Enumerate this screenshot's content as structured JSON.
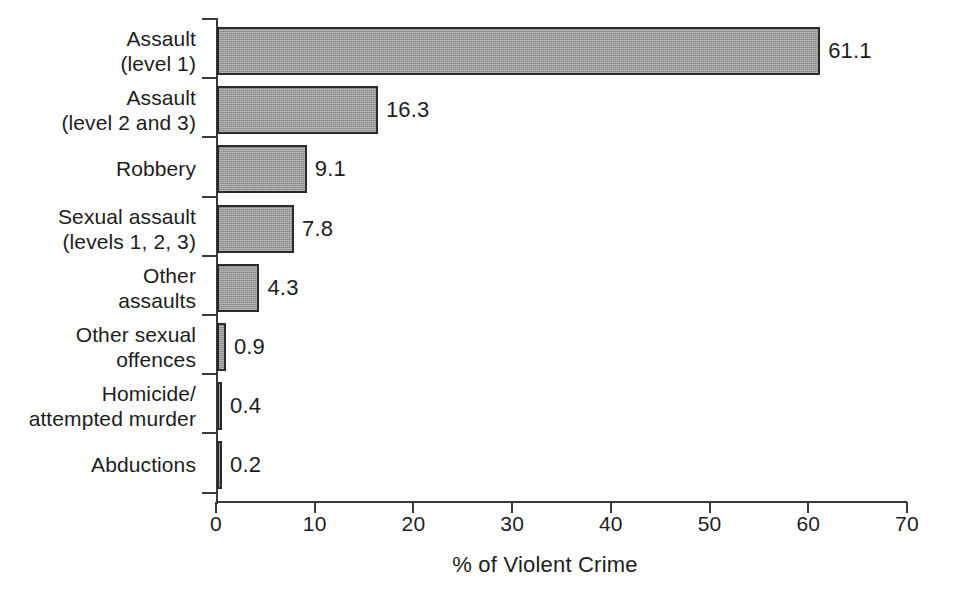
{
  "chart_data": {
    "type": "bar",
    "orientation": "horizontal",
    "title": "",
    "xlabel": "% of Violent Crime",
    "ylabel": "",
    "xlim": [
      0,
      70
    ],
    "xticks": [
      0,
      10,
      20,
      30,
      40,
      50,
      60,
      70
    ],
    "grid": false,
    "legend": null,
    "bar_fill_color": "#9a9a9a",
    "bar_border_color": "#2b2b2b",
    "axis_color": "#3a3a3a",
    "background_color": "#ffffff",
    "categories": [
      "Assault\n(level 1)",
      "Assault\n(level 2 and 3)",
      "Robbery",
      "Sexual assault\n(levels 1, 2, 3)",
      "Other\nassaults",
      "Other sexual\noffences",
      "Homicide/\nattempted murder",
      "Abductions"
    ],
    "values": [
      61.1,
      16.3,
      9.1,
      7.8,
      4.3,
      0.9,
      0.4,
      0.2
    ],
    "data_labels": [
      "61.1",
      "16.3",
      "9.1",
      "7.8",
      "4.3",
      "0.9",
      "0.4",
      "0.2"
    ],
    "rows": [
      {
        "label_line1": "Assault",
        "label_line2": "(level 1)",
        "value": 61.1,
        "value_label": "61.1"
      },
      {
        "label_line1": "Assault",
        "label_line2": "(level 2 and 3)",
        "value": 16.3,
        "value_label": "16.3"
      },
      {
        "label_line1": "Robbery",
        "label_line2": "",
        "value": 9.1,
        "value_label": "9.1"
      },
      {
        "label_line1": "Sexual assault",
        "label_line2": "(levels 1, 2, 3)",
        "value": 7.8,
        "value_label": "7.8"
      },
      {
        "label_line1": "Other",
        "label_line2": "assaults",
        "value": 4.3,
        "value_label": "4.3"
      },
      {
        "label_line1": "Other sexual",
        "label_line2": "offences",
        "value": 0.9,
        "value_label": "0.9"
      },
      {
        "label_line1": "Homicide/",
        "label_line2": "attempted murder",
        "value": 0.4,
        "value_label": "0.4"
      },
      {
        "label_line1": "Abductions",
        "label_line2": "",
        "value": 0.2,
        "value_label": "0.2"
      }
    ]
  },
  "axis": {
    "x_tick_labels": [
      "0",
      "10",
      "20",
      "30",
      "40",
      "50",
      "60",
      "70"
    ],
    "x_title": "% of Violent Crime"
  }
}
